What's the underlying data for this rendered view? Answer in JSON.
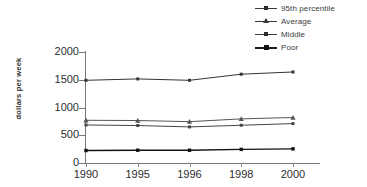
{
  "chart_data": {
    "type": "line",
    "title": "",
    "subtitle": "",
    "xlabel": "",
    "ylabel": "dollars per week",
    "categories": [
      "1990",
      "1995",
      "1996",
      "1998",
      "2000"
    ],
    "x": [
      1990,
      1995,
      1996,
      1998,
      2000
    ],
    "ylim": [
      0,
      2000
    ],
    "yticks": [
      0,
      500,
      1000,
      1500,
      2000
    ],
    "ytick_labels": [
      "0",
      "500",
      "1000",
      "1500",
      "2000"
    ],
    "grid": false,
    "legend_position": "top-right",
    "series": [
      {
        "name": "95th percentile",
        "marker": "square",
        "color": "#333333",
        "values": [
          1490,
          1515,
          1490,
          1600,
          1640
        ]
      },
      {
        "name": "Average",
        "marker": "triangle",
        "color": "#555555",
        "values": [
          770,
          765,
          745,
          795,
          820
        ]
      },
      {
        "name": "Middle",
        "marker": "square",
        "color": "#444444",
        "values": [
          685,
          675,
          650,
          680,
          710
        ]
      },
      {
        "name": "Poor",
        "marker": "square",
        "color": "#111111",
        "values": [
          225,
          230,
          230,
          245,
          255
        ]
      }
    ]
  },
  "legend": {
    "items": [
      {
        "label": "95th percentile"
      },
      {
        "label": "Average"
      },
      {
        "label": "Middle"
      },
      {
        "label": "Poor"
      }
    ]
  },
  "axes": {
    "y": {
      "label": "dollars per week",
      "ticks": [
        "2000",
        "1500",
        "1000",
        "500",
        "0"
      ]
    },
    "x": {
      "ticks": [
        "1990",
        "1995",
        "1996",
        "1998",
        "2000"
      ]
    }
  },
  "colors": {
    "background": "#ffffff",
    "axis": "#777777",
    "text": "#2e2e2e",
    "line_default": "#3a3a3a"
  }
}
